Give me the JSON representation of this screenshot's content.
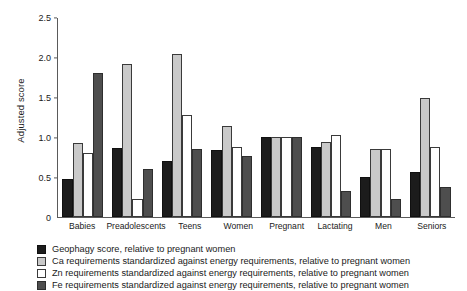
{
  "chart_data": {
    "type": "bar",
    "title": "",
    "xlabel": "",
    "ylabel": "Adjusted score",
    "ylim": [
      0,
      2.5
    ],
    "yticks": [
      0,
      0.5,
      1.0,
      1.5,
      2.0,
      2.5
    ],
    "ytick_labels": [
      "0",
      "0.5",
      "1.0",
      "1.5",
      "2.0",
      "2.5"
    ],
    "grid": false,
    "legend_position": "below",
    "categories": [
      "Babies",
      "Preadolescents",
      "Teens",
      "Women",
      "Pregnant",
      "Lactating",
      "Men",
      "Seniors"
    ],
    "series": [
      {
        "name": "Geophagy score, relative to pregnant women",
        "color": "#1c1c1c",
        "values": [
          0.47,
          0.86,
          0.7,
          0.84,
          1.0,
          0.87,
          0.5,
          0.56
        ]
      },
      {
        "name": "Ca requirements standardized against energy requirements, relative to pregnant women",
        "color": "#c9c9c9",
        "values": [
          0.92,
          1.91,
          2.03,
          1.13,
          1.0,
          0.93,
          0.85,
          1.48
        ]
      },
      {
        "name": "Zn requirements standardized against energy requirements, relative to pregnant women",
        "color": "#ffffff",
        "values": [
          0.8,
          0.22,
          1.27,
          0.87,
          1.0,
          1.02,
          0.85,
          0.87
        ]
      },
      {
        "name": "Fe requirements standardized against energy requirements, relative to pregnant women",
        "color": "#4e4e4e",
        "values": [
          1.8,
          0.6,
          0.85,
          0.76,
          1.0,
          0.32,
          0.22,
          0.37
        ]
      }
    ]
  }
}
